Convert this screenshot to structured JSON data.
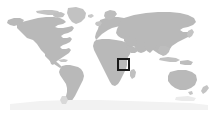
{
  "map": {
    "type": "world-locator-map",
    "title": "",
    "caption": "",
    "projection": "equirectangular",
    "dimensions": {
      "width": 214,
      "height": 114
    },
    "colors": {
      "background": "#ffffff",
      "land": "#b9b9b9",
      "land_shadow": "#c9c9c9",
      "highlight_border": "#1a1a1a",
      "highlight_fill": "transparent"
    },
    "highlight": {
      "name": "east-africa-region",
      "label": "",
      "x": 117,
      "y": 58,
      "width": 13,
      "height": 13,
      "border_width": 2,
      "border_color": "#1a1a1a"
    },
    "landmasses": [
      {
        "name": "north-america",
        "label": "North America"
      },
      {
        "name": "south-america",
        "label": "South America"
      },
      {
        "name": "greenland",
        "label": "Greenland"
      },
      {
        "name": "europe",
        "label": "Europe"
      },
      {
        "name": "africa",
        "label": "Africa"
      },
      {
        "name": "asia",
        "label": "Asia"
      },
      {
        "name": "australia",
        "label": "Australia"
      },
      {
        "name": "new-zealand",
        "label": "New Zealand"
      },
      {
        "name": "japan",
        "label": "Japan"
      },
      {
        "name": "madagascar",
        "label": "Madagascar"
      },
      {
        "name": "indonesia",
        "label": "Indonesia"
      },
      {
        "name": "british-isles",
        "label": "British Isles"
      },
      {
        "name": "iceland",
        "label": "Iceland"
      },
      {
        "name": "caribbean",
        "label": "Caribbean"
      },
      {
        "name": "antarctica-fringe",
        "label": "Antarctica"
      }
    ]
  }
}
